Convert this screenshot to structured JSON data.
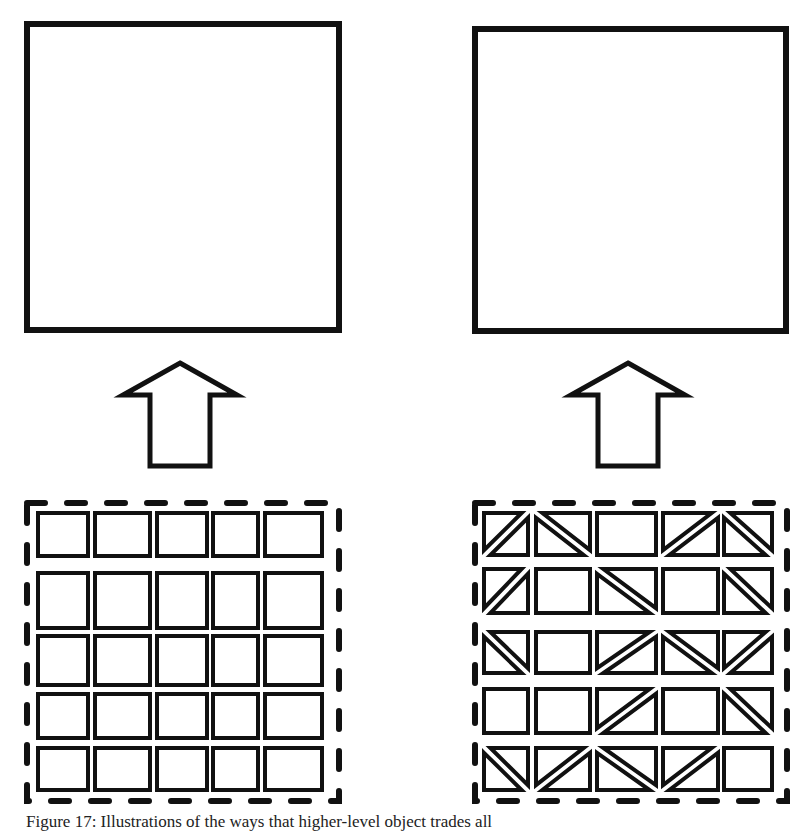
{
  "figure": {
    "caption": "Figure 17: Illustrations of the ways that higher-level object trades all",
    "stroke_color": "#111111",
    "background": "#ffffff",
    "panels": [
      {
        "name": "left",
        "top_shape": "solid-square",
        "arrow": "up",
        "grid_rows": 5,
        "grid_cols": 5,
        "cells": [
          [
            "plain",
            "plain",
            "plain",
            "plain",
            "plain"
          ],
          [
            "plain",
            "plain",
            "plain",
            "plain",
            "plain"
          ],
          [
            "plain",
            "plain",
            "plain",
            "plain",
            "plain"
          ],
          [
            "plain",
            "plain",
            "plain",
            "plain",
            "plain"
          ],
          [
            "plain",
            "plain",
            "plain",
            "plain",
            "plain"
          ]
        ]
      },
      {
        "name": "right",
        "top_shape": "solid-square",
        "arrow": "up",
        "grid_rows": 5,
        "grid_cols": 5,
        "cells": [
          [
            "slash",
            "backslash",
            "plain",
            "slash",
            "backslash"
          ],
          [
            "slash",
            "plain",
            "backslash",
            "plain",
            "backslash"
          ],
          [
            "backslash",
            "plain",
            "slash",
            "backslash",
            "slash"
          ],
          [
            "plain",
            "plain",
            "slash",
            "plain",
            "backslash"
          ],
          [
            "backslash",
            "slash",
            "backslash",
            "slash",
            "plain"
          ]
        ]
      }
    ]
  }
}
